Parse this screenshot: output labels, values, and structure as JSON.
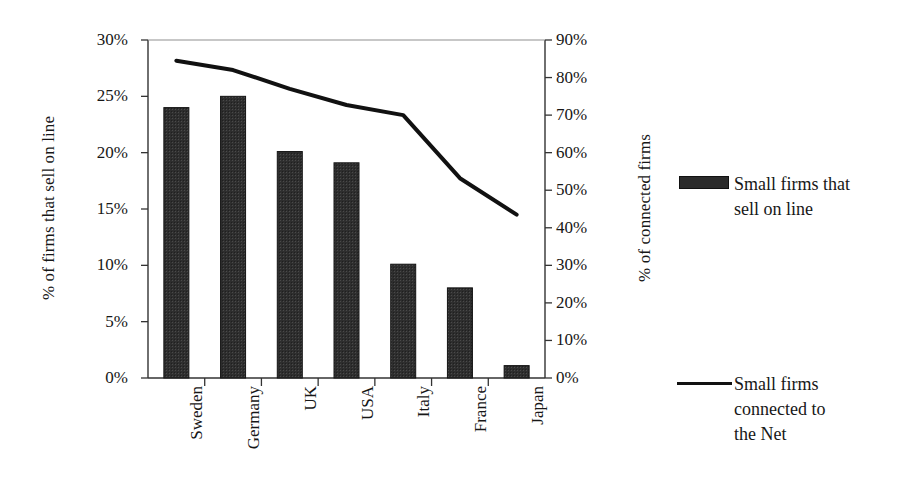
{
  "chart_data": {
    "type": "bar",
    "title": "",
    "subtitle": "",
    "xlabel": "",
    "categories": [
      "Sweden",
      "Germany",
      "UK",
      "USA",
      "Italy",
      "France",
      "Japan"
    ],
    "series": [
      {
        "name": "Small firms that\nsell on line",
        "type": "bar",
        "axis": "left",
        "unit": "%",
        "color": "#2b2b2b",
        "values": [
          24.0,
          25.0,
          20.1,
          19.1,
          10.1,
          8.0,
          1.1
        ]
      },
      {
        "name": "Small firms\nconnected to\nthe Net",
        "type": "line",
        "axis": "right",
        "unit": "%",
        "color": "#111111",
        "values": [
          84.5,
          82.0,
          77.0,
          72.7,
          70.0,
          53.2,
          43.5
        ]
      }
    ],
    "left_axis": {
      "label": "% of firms that sell on line",
      "ticks": [
        "0%",
        "5%",
        "10%",
        "15%",
        "20%",
        "25%",
        "30%"
      ],
      "values": [
        0,
        5,
        10,
        15,
        20,
        25,
        30
      ],
      "ylim": [
        0,
        30
      ]
    },
    "right_axis": {
      "label": "% of connected firms",
      "ticks": [
        "0%",
        "10%",
        "20%",
        "30%",
        "40%",
        "50%",
        "60%",
        "70%",
        "80%",
        "90%"
      ],
      "values": [
        0,
        10,
        20,
        30,
        40,
        50,
        60,
        70,
        80,
        90
      ],
      "ylim": [
        0,
        90
      ]
    },
    "grid": false,
    "legend_position": "right",
    "background": "#ffffff"
  },
  "legend": {
    "entries": [
      {
        "label": "Small firms that\nsell on line",
        "marker": "filled-rectangle-swatch"
      },
      {
        "label": "Small firms\nconnected to\nthe Net",
        "marker": "line-swatch"
      }
    ]
  }
}
